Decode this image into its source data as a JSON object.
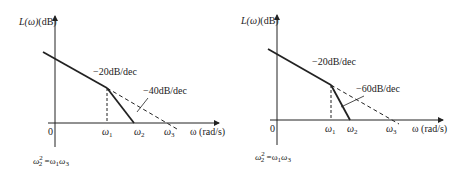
{
  "diagrams": [
    {
      "id": "left",
      "y_axis_label": "L(ω)(dB)",
      "x_axis_label": "ω(rad/s)",
      "origin_label": "0",
      "tick_labels": [
        "ω1",
        "ω2",
        "ω3"
      ],
      "slope_labels": [
        "−20dB/dec",
        "−40dB/dec"
      ],
      "formula": "ω2² = ω1 ω3"
    },
    {
      "id": "right",
      "y_axis_label": "L(ω)(dB)",
      "x_axis_label": "ω(rad/s)",
      "origin_label": "0",
      "tick_labels": [
        "ω1",
        "ω2",
        "ω3"
      ],
      "slope_labels": [
        "−20dB/dec",
        "−60dB/dec"
      ],
      "formula": "ω2² = ω1 ω3"
    }
  ],
  "text": {
    "left_ylabel_main": "L(ω)",
    "left_ylabel_unit": "(dB)",
    "left_xlabel": "ω (rad/s)",
    "left_origin": "0",
    "left_w1": "ω",
    "left_w1_sub": "1",
    "left_w2": "ω",
    "left_w2_sub": "2",
    "left_w3": "ω",
    "left_w3_sub": "3",
    "left_slope1": "−20dB/dec",
    "left_slope2": "−40dB/dec",
    "left_formula_lhs": "ω",
    "left_formula_sub": "2",
    "left_formula_sup": "2",
    "left_formula_rhs": " =ω",
    "left_formula_rhs_sub1": "1",
    "left_formula_rhs2": "ω",
    "left_formula_rhs_sub3": "3",
    "right_ylabel_main": "L(ω)",
    "right_ylabel_unit": "(dB)",
    "right_xlabel": "ω (rad/s)",
    "right_origin": "0",
    "right_w1": "ω",
    "right_w1_sub": "1",
    "right_w2": "ω",
    "right_w2_sub": "2",
    "right_w3": "ω",
    "right_w3_sub": "3",
    "right_slope1": "−20dB/dec",
    "right_slope2": "−60dB/dec",
    "right_formula_lhs": "ω",
    "right_formula_sub": "2",
    "right_formula_sup": "2",
    "right_formula_rhs": " =ω",
    "right_formula_rhs_sub1": "1",
    "right_formula_rhs2": "ω",
    "right_formula_rhs_sub3": "3"
  },
  "colors": {
    "line": "#222222",
    "background": "#ffffff"
  }
}
